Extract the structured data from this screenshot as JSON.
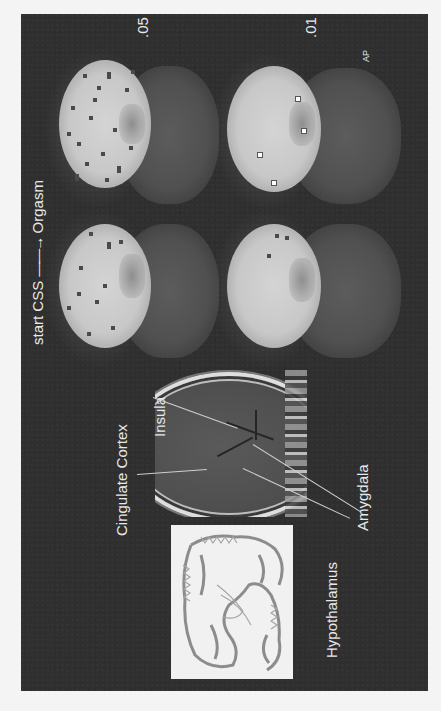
{
  "figure": {
    "title_start": "start CSS",
    "title_arrow": "——→",
    "title_end": "Orgasm",
    "thresholds": [
      ".05",
      ".01"
    ],
    "orientation_label": "AP",
    "colors": {
      "background": "#f4f4f4",
      "panel": "#2f2f2f",
      "label_text": "#e8e8e8",
      "activation_bright": "#d0d0d0",
      "histology_bg": "#f1f1f1"
    }
  },
  "scans": [
    {
      "id": "start-005",
      "phase": "start CSS",
      "threshold": ".05"
    },
    {
      "id": "orgasm-005",
      "phase": "Orgasm",
      "threshold": ".05"
    },
    {
      "id": "start-001",
      "phase": "start CSS",
      "threshold": ".01"
    },
    {
      "id": "orgasm-001",
      "phase": "Orgasm",
      "threshold": ".01"
    }
  ],
  "anatomy": {
    "labels": {
      "cingulate": "Cingulate Cortex",
      "insula": "Insula",
      "hypothalamus": "Hypothalamus",
      "amygdala": "Amygdala"
    }
  }
}
